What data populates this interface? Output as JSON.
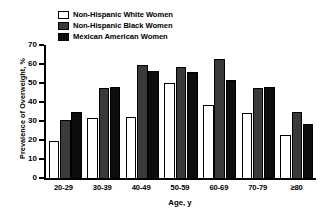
{
  "chart_data": {
    "type": "bar",
    "title": "",
    "xlabel": "Age, y",
    "ylabel": "Prevalence of Overweight, %",
    "categories": [
      "20-29",
      "30-39",
      "40-49",
      "50-59",
      "60-69",
      "70-79",
      "≥80"
    ],
    "ylim": [
      0,
      70
    ],
    "yticks": [
      0,
      10,
      20,
      30,
      40,
      50,
      60,
      70
    ],
    "grid": false,
    "legend_position": "top-left",
    "series": [
      {
        "name": "Non-Hispanic White Women",
        "color": "#ffffff",
        "values": [
          19.5,
          31.5,
          32.0,
          50.0,
          38.5,
          34.0,
          22.5
        ]
      },
      {
        "name": "Non-Hispanic Black Women",
        "color": "#3a3a3a",
        "values": [
          30.5,
          47.5,
          59.5,
          58.5,
          62.5,
          47.5,
          35.0
        ]
      },
      {
        "name": "Mexican American Women",
        "color": "#0d0d0d",
        "values": [
          35.0,
          48.0,
          56.5,
          56.0,
          51.5,
          48.0,
          28.5
        ]
      }
    ]
  }
}
